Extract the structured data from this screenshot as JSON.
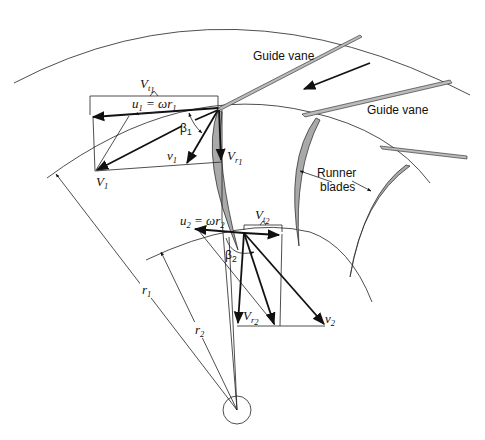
{
  "figure": {
    "kind": "Velocity triangles at inlet and outlet of a reaction turbine runner",
    "labels": {
      "guide_vane_top": "Guide vane",
      "guide_vane_right": "Guide vane",
      "runner_blades_line1": "Runner",
      "runner_blades_line2": "blades",
      "vt1_main": "V",
      "vt1_sub": "t",
      "vt1_subsub": "1",
      "u1": "u",
      "u1_sub": "1",
      "u1_eq": " = ωr",
      "u1_eq_sub": "1",
      "beta1": "β",
      "beta1_sub": "1",
      "v1": "v",
      "v1_sub": "1",
      "V1": "V",
      "V1_sub": "1",
      "vr1": "V",
      "vr1_sub": "r",
      "vr1_subsub": "1",
      "u2": "u",
      "u2_sub": "2",
      "u2_eq": " = ωr",
      "u2_eq_sub": "2",
      "vt2": "V",
      "vt2_sub": "t",
      "vt2_subsub": "2",
      "beta2": "β",
      "beta2_sub": "2",
      "vr2": "V",
      "vr2_sub": "r",
      "vr2_subsub": "2",
      "v2": "v",
      "v2_sub": "2",
      "r1": "r",
      "r1_sub": "1",
      "r2": "r",
      "r2_sub": "2"
    },
    "colors": {
      "line": "#222222",
      "blade_fill": "#a9a9a9",
      "background": "#ffffff"
    }
  }
}
